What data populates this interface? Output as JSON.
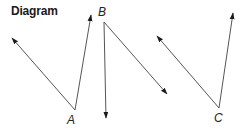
{
  "title": "Diagram",
  "colors": {
    "ray": "#555555",
    "arrowhead": "#1a1a1a",
    "text": "#222222",
    "background": "#ffffff"
  },
  "angles": [
    {
      "label": "A",
      "vertex": [
        75,
        110
      ],
      "label_pos": [
        67,
        124
      ],
      "rays": [
        {
          "to": [
            12,
            38
          ]
        },
        {
          "to": [
            91,
            15
          ]
        }
      ]
    },
    {
      "label": "B",
      "vertex": [
        104,
        22
      ],
      "label_pos": [
        98,
        16
      ],
      "rays": [
        {
          "to": [
            106,
            118
          ]
        },
        {
          "to": [
            167,
            94
          ]
        }
      ]
    },
    {
      "label": "C",
      "vertex": [
        219,
        108
      ],
      "label_pos": [
        214,
        122
      ],
      "rays": [
        {
          "to": [
            157,
            36
          ]
        },
        {
          "to": [
            233,
            13
          ]
        }
      ]
    }
  ]
}
